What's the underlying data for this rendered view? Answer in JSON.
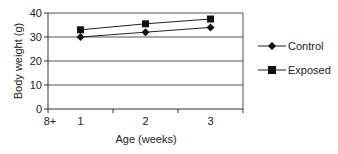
{
  "chart_data": {
    "type": "line",
    "title": "",
    "xlabel": "Age (weeks)",
    "ylabel": "Body weight (g)",
    "ylim": [
      0,
      40
    ],
    "yticks": [
      0,
      10,
      20,
      30,
      40
    ],
    "grid": true,
    "legend_position": "right",
    "x_axis_extra_label": "8+",
    "categories": [
      "1",
      "2",
      "3"
    ],
    "series": [
      {
        "name": "Control",
        "marker": "diamond",
        "values": [
          30,
          32,
          34
        ]
      },
      {
        "name": "Exposed",
        "marker": "square",
        "values": [
          33,
          35.5,
          37.5
        ]
      }
    ]
  },
  "legend": {
    "items": [
      {
        "label": "Control",
        "marker": "diamond-icon"
      },
      {
        "label": "Exposed",
        "marker": "square-icon"
      }
    ]
  },
  "colors": {
    "line": "#222222",
    "grid": "#555555",
    "background": "#ffffff"
  }
}
